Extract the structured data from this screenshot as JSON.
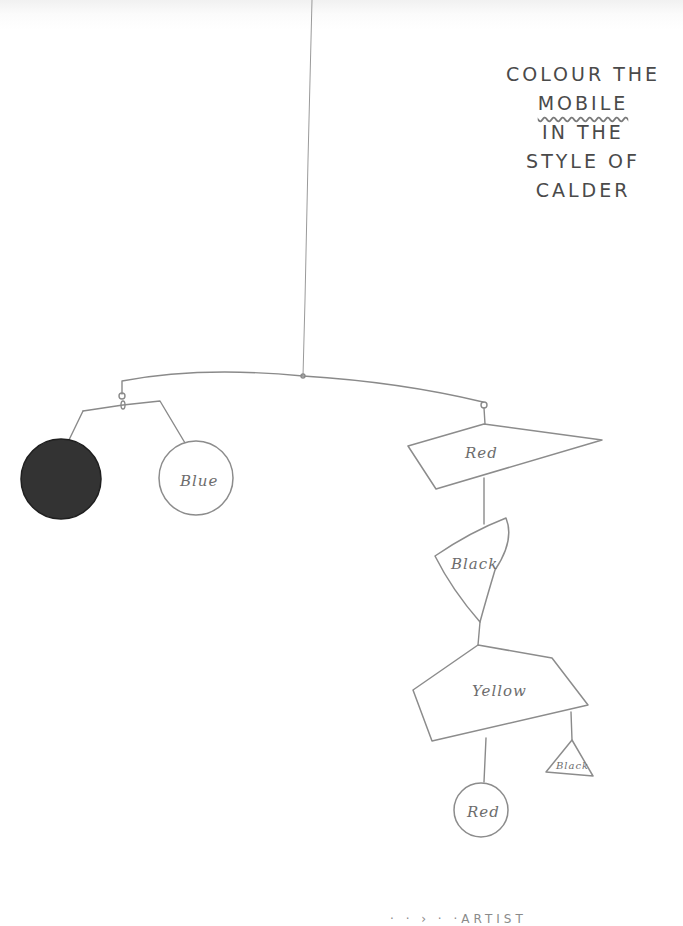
{
  "worksheet": {
    "title_lines": [
      "COLOUR THE",
      "MOBILE",
      "IN THE",
      "STYLE OF",
      "CALDER"
    ],
    "underlined_word": "MOBILE",
    "footer_partial": "·      ·   ›    ·  ·ARTIST"
  },
  "mobile": {
    "left_branch": [
      {
        "shape": "circle",
        "label": "",
        "fill": "#333333",
        "note": "pre-filled black"
      },
      {
        "shape": "circle",
        "label": "Blue"
      }
    ],
    "right_branch": [
      {
        "shape": "quadrilateral",
        "label": "Red"
      },
      {
        "shape": "shield",
        "label": "Black"
      },
      {
        "shape": "pentagon",
        "label": "Yellow"
      },
      {
        "shape": "triangle",
        "label": "Black"
      },
      {
        "shape": "circle",
        "label": "Red"
      }
    ]
  },
  "colors": {
    "pencil": "#8a8a8a",
    "filled_circle": "#333333",
    "paper": "#ffffff"
  }
}
